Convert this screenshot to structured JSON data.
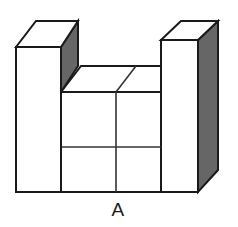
{
  "figure": {
    "label": "A",
    "shape_name": "u-shaped-block-stack",
    "projection": "isometric",
    "colors": {
      "face_front": "#ffffff",
      "face_top": "#ffffff",
      "face_side_shaded": "#666666",
      "outline": "#1a1a1a",
      "seam": "#333333",
      "background": "#ffffff",
      "label_color": "#1a1a1a"
    },
    "stroke": {
      "outline_width": 2,
      "seam_width": 1.6
    },
    "parts": [
      {
        "name": "left-tower",
        "front_face": [
          [
            16,
            47
          ],
          [
            61,
            47
          ],
          [
            61,
            192
          ],
          [
            16,
            192
          ]
        ],
        "top_face": [
          [
            16,
            47
          ],
          [
            36,
            21
          ],
          [
            78,
            21
          ],
          [
            61,
            47
          ]
        ],
        "side_face": [
          [
            61,
            47
          ],
          [
            78,
            21
          ],
          [
            78,
            66
          ],
          [
            61,
            92
          ]
        ]
      },
      {
        "name": "middle-row",
        "top_face": [
          [
            61,
            92
          ],
          [
            81,
            66
          ],
          [
            161,
            66
          ],
          [
            161,
            92
          ]
        ],
        "front_face": [
          [
            61,
            92
          ],
          [
            161,
            92
          ],
          [
            161,
            192
          ],
          [
            61,
            192
          ]
        ],
        "seam_vertical_x": 116,
        "seam_horizontal_y": 147,
        "top_diagonal": [
          [
            116,
            92
          ],
          [
            136,
            66
          ]
        ]
      },
      {
        "name": "right-tower",
        "front_face": [
          [
            161,
            40
          ],
          [
            198,
            40
          ],
          [
            198,
            192
          ],
          [
            161,
            192
          ]
        ],
        "top_face": [
          [
            161,
            40
          ],
          [
            181,
            21
          ],
          [
            218,
            21
          ],
          [
            198,
            40
          ]
        ],
        "side_face": [
          [
            198,
            40
          ],
          [
            218,
            21
          ],
          [
            218,
            170
          ],
          [
            198,
            192
          ]
        ]
      }
    ]
  }
}
